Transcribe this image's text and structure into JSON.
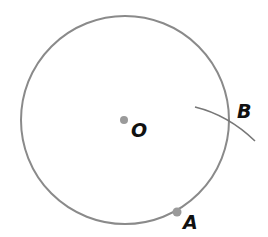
{
  "diagram": {
    "circle": {
      "cx": 125,
      "cy": 120,
      "r": 104,
      "stroke": "#8a8a8a"
    },
    "points": [
      {
        "label": "O",
        "x": 124,
        "y": 120,
        "lx": 131,
        "ly": 137
      },
      {
        "label": "A",
        "x": 177,
        "y": 212,
        "lx": 183,
        "ly": 229
      },
      {
        "label": "B",
        "x": 229,
        "y": 120,
        "lx": 237,
        "ly": 118
      }
    ],
    "arc": {
      "from": [
        195,
        107
      ],
      "ctrl": [
        228,
        115
      ],
      "to": [
        255,
        141
      ]
    },
    "dot_color": "#9a9a9a"
  }
}
